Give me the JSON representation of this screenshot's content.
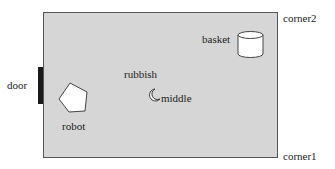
{
  "diagram": {
    "type": "room-layout",
    "room": {
      "fill": "#d6d6d6",
      "border": "#555555"
    },
    "labels": {
      "door": "door",
      "robot": "robot",
      "rubbish": "rubbish",
      "middle": "middle",
      "basket": "basket",
      "corner1": "corner1",
      "corner2": "corner2"
    },
    "objects": [
      {
        "name": "door",
        "shape": "bar",
        "color": "#1a1a1a"
      },
      {
        "name": "robot",
        "shape": "pentagon",
        "color": "#ffffff"
      },
      {
        "name": "rubbish",
        "shape": "crescent",
        "color": "#ffffff"
      },
      {
        "name": "basket",
        "shape": "cylinder",
        "color": "#ffffff"
      }
    ]
  }
}
